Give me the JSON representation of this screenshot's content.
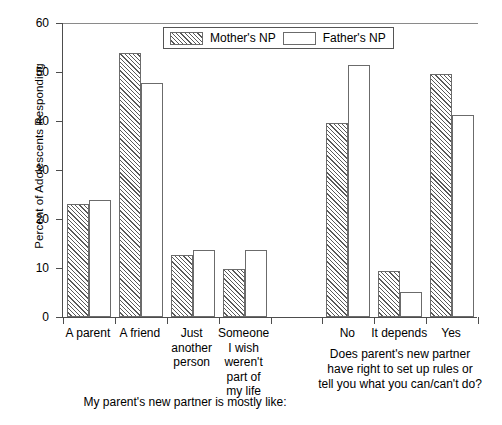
{
  "axes": {
    "ylabel": "Percent of Adolescents Responding",
    "yticks": [
      "0",
      "10",
      "20",
      "30",
      "40",
      "50",
      "60"
    ]
  },
  "legend": {
    "items": [
      {
        "label": "Mother's NP",
        "style": "hatched",
        "swatch_name": "legend-swatch-mothers-np"
      },
      {
        "label": "Father's NP",
        "style": "open",
        "swatch_name": "legend-swatch-fathers-np"
      }
    ]
  },
  "captions": {
    "left": "My parent's new partner is mostly like:",
    "right": "Does parent's new partner\nhave right to set up rules or\ntell you what you can/can't do?"
  },
  "chart_data": {
    "type": "bar",
    "title": "",
    "xlabel": "",
    "ylabel": "Percent of Adolescents Responding",
    "ylim": [
      0,
      60
    ],
    "yticks": [
      0,
      10,
      20,
      30,
      40,
      50,
      60
    ],
    "grid": false,
    "legend_position": "top-center",
    "categories": [
      "A parent",
      "A friend",
      "Just another person",
      "Someone I wish weren't part of my life",
      "No",
      "It depends",
      "Yes"
    ],
    "category_labels": [
      "A parent",
      "A friend",
      "Just\nanother\nperson",
      "Someone\nI wish\nweren't\npart of\nmy life",
      "No",
      "It depends",
      "Yes"
    ],
    "series": [
      {
        "name": "Mother's NP",
        "values": [
          23.1,
          53.9,
          12.7,
          9.8,
          39.6,
          9.4,
          49.5
        ]
      },
      {
        "name": "Father's NP",
        "values": [
          23.9,
          47.8,
          13.7,
          13.7,
          51.4,
          5.1,
          41.2
        ]
      }
    ],
    "panels": [
      {
        "caption": "My parent's new partner is mostly like:",
        "categories": [
          "A parent",
          "A friend",
          "Just another person",
          "Someone I wish weren't part of my life"
        ]
      },
      {
        "caption": "Does parent's new partner have right to set up rules or tell you what you can/can't do?",
        "categories": [
          "No",
          "It depends",
          "Yes"
        ]
      }
    ]
  }
}
